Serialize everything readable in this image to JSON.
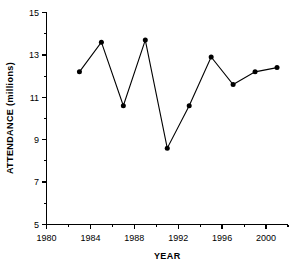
{
  "chart_data": {
    "type": "line",
    "title": "",
    "xlabel": "YEAR",
    "ylabel": "ATTENDANCE (millions)",
    "xlim": [
      1980,
      2002
    ],
    "ylim": [
      5,
      15
    ],
    "grid": false,
    "legend": "none",
    "x_ticks_major": [
      1980,
      1984,
      1988,
      1992,
      1996,
      2000
    ],
    "x_tick_labels": [
      "1980",
      "1984",
      "1988",
      "1992",
      "1996",
      "2000"
    ],
    "x_ticks_minor": [
      1982,
      1986,
      1990,
      1994,
      1998,
      2002
    ],
    "y_ticks_major": [
      5,
      7,
      9,
      11,
      13,
      15
    ],
    "y_tick_labels": [
      "5",
      "7",
      "9",
      "11",
      "13",
      "15"
    ],
    "y_ticks_minor": [
      6,
      8,
      10,
      12,
      14
    ],
    "marker": "filled-circle",
    "x": [
      1983,
      1985,
      1987,
      1989,
      1991,
      1993,
      1995,
      1997,
      1999,
      2001
    ],
    "values": [
      12.2,
      13.6,
      10.6,
      13.7,
      8.6,
      10.6,
      12.9,
      11.6,
      12.2,
      12.4
    ],
    "series": [
      {
        "name": "Attendance",
        "x": [
          1983,
          1985,
          1987,
          1989,
          1991,
          1993,
          1995,
          1997,
          1999,
          2001
        ],
        "values": [
          12.2,
          13.6,
          10.6,
          13.7,
          8.6,
          10.6,
          12.9,
          11.6,
          12.2,
          12.4
        ]
      }
    ],
    "colors": {
      "line": "#000000",
      "marker": "#000000",
      "axis": "#000000",
      "background": "#ffffff"
    }
  }
}
